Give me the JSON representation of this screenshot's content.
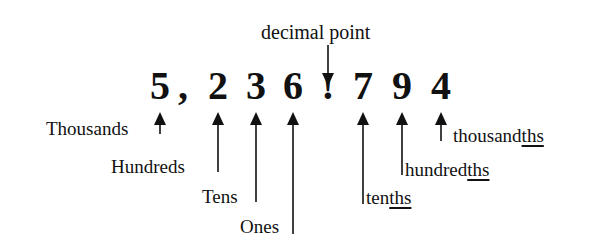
{
  "title_label": "decimal point",
  "number": {
    "digits": [
      {
        "char": "5",
        "x": 160
      },
      {
        "char": ",",
        "x": 185
      },
      {
        "char": "2",
        "x": 218
      },
      {
        "char": "3",
        "x": 256
      },
      {
        "char": "6",
        "x": 293
      },
      {
        "char": "!",
        "x": 328
      },
      {
        "char": "7",
        "x": 363
      },
      {
        "char": "9",
        "x": 402
      },
      {
        "char": "4",
        "x": 441
      }
    ],
    "full_value": "5,236.794"
  },
  "place_values": {
    "thousands": {
      "label": "Thousands"
    },
    "hundreds": {
      "label": "Hundreds"
    },
    "tens": {
      "label": "Tens"
    },
    "ones": {
      "label": "Ones"
    },
    "tenths": {
      "prefix": "ten",
      "suffix": "ths"
    },
    "hundredths": {
      "prefix": "hundred",
      "suffix": "ths"
    },
    "thousandths": {
      "prefix": "thousand",
      "suffix": "ths"
    }
  }
}
